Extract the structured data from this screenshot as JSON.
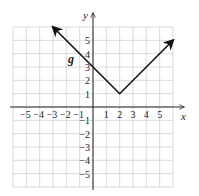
{
  "chart_data": {
    "type": "line",
    "title": "",
    "xlabel": "x",
    "ylabel": "y",
    "xlim": [
      -6,
      6
    ],
    "ylim": [
      -6,
      6
    ],
    "grid": true,
    "x_ticks": [
      "-5",
      "-4",
      "-3",
      "-2",
      "-1",
      "1",
      "2",
      "3",
      "4",
      "5"
    ],
    "y_ticks": [
      "5",
      "4",
      "3",
      "2",
      "1",
      "-1",
      "-2",
      "-3",
      "-4",
      "-5"
    ],
    "series": [
      {
        "name": "g",
        "equation": "g(x) = |x - 2| + 1",
        "points": [
          [
            -3,
            6
          ],
          [
            0,
            3
          ],
          [
            2,
            1
          ],
          [
            6,
            5
          ]
        ],
        "arrows_at_ends": true
      }
    ],
    "annotations": [
      {
        "text": "g",
        "x": -1.2,
        "y": 3.5
      }
    ]
  },
  "labels": {
    "x_axis": "x",
    "y_axis": "y",
    "function": "g"
  },
  "colors": {
    "grid": "#cfcfcf",
    "axis": "#222222",
    "curve": "#111111"
  }
}
